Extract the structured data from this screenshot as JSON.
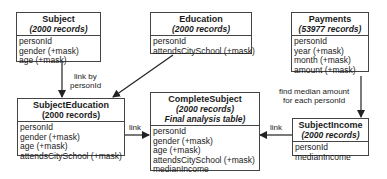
{
  "tables": {
    "subject": {
      "name": "Subject",
      "records": "(2000 records)",
      "fields": [
        "personId",
        "gender (+mask)",
        "age (+mask)"
      ]
    },
    "education": {
      "name": "Education",
      "records": "(2000 records)",
      "fields": [
        "personId",
        "attendsCitySchool (+mask)"
      ]
    },
    "payments": {
      "name": "Payments",
      "records": "(53977 records)",
      "fields": [
        "personId",
        "year (+mask)",
        "month (+mask)",
        "amount (+mask)"
      ]
    },
    "subject_education": {
      "name": "SubjectEducation",
      "records": "(2000 records)",
      "fields": [
        "personId",
        "gender (+mask)",
        "age (+mask)",
        "attendsCitySchool (+mask)"
      ]
    },
    "complete_subject": {
      "name": "CompleteSubject",
      "records": "(2000 records)",
      "note": "Final analysis table)",
      "fields": [
        "personId",
        "gender (+mask)",
        "age (+mask)",
        "attendsCitySchool (+mask)",
        "medianIncome"
      ]
    },
    "subject_income": {
      "name": "SubjectIncome",
      "records": "(2000 records)",
      "fields": [
        "personId",
        "medianIncome"
      ]
    }
  },
  "labels": {
    "link_by_1": "link by",
    "link_by_2": "personId",
    "find_median_1": "find median amount",
    "find_median_2": "for each personId",
    "link_left": "link",
    "link_right": "link"
  },
  "colors": {
    "line": "#222222",
    "border": "#444444"
  }
}
